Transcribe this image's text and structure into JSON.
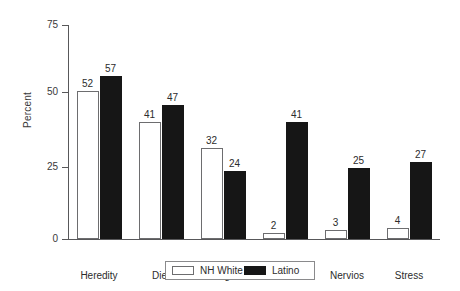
{
  "chart_data": {
    "type": "bar",
    "title": "",
    "xlabel": "",
    "ylabel": "Percent",
    "ylim": [
      0,
      75
    ],
    "yticks": [
      "0",
      "25",
      "50",
      "75"
    ],
    "grid": false,
    "legend_position": "bottom-center",
    "categories": [
      "Heredity",
      "Diet",
      "Weight",
      "Susto",
      "Nervios",
      "Stress"
    ],
    "series": [
      {
        "name": "NH White",
        "color": "#ffffff",
        "values": [
          52,
          41,
          32,
          2,
          3,
          4
        ]
      },
      {
        "name": "Latino",
        "color": "#161616",
        "values": [
          57,
          47,
          24,
          41,
          25,
          27
        ]
      }
    ]
  },
  "axis": {
    "y_title": "Percent",
    "ticks": [
      {
        "label": "0"
      },
      {
        "label": "25"
      },
      {
        "label": "50"
      },
      {
        "label": "75"
      }
    ]
  },
  "legend": {
    "items": [
      {
        "label": "NH White"
      },
      {
        "label": "Latino"
      }
    ]
  }
}
